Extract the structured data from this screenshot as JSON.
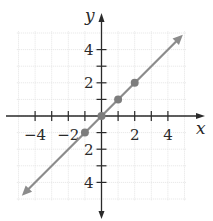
{
  "chart_data": {
    "type": "line",
    "title": "",
    "xlabel": "x",
    "ylabel": "y",
    "xlim": [
      -5,
      5
    ],
    "ylim": [
      -5,
      5
    ],
    "grid": true,
    "x_ticks": [
      -4,
      -3,
      -2,
      -1,
      1,
      2,
      3,
      4
    ],
    "y_ticks": [
      -4,
      -3,
      -2,
      -1,
      1,
      2,
      3,
      4
    ],
    "x_tick_labels": [
      {
        "value": -4,
        "text": "−4"
      },
      {
        "value": -2,
        "text": "−2"
      },
      {
        "value": 2,
        "text": "2"
      },
      {
        "value": 4,
        "text": "4"
      }
    ],
    "y_tick_labels": [
      {
        "value": 4,
        "text": "4"
      },
      {
        "value": 2,
        "text": "2"
      },
      {
        "value": -2,
        "text": "2"
      },
      {
        "value": -4,
        "text": "4"
      }
    ],
    "series": [
      {
        "name": "y = x",
        "type": "line",
        "arrows": "both",
        "x": [
          -4.8,
          4.9
        ],
        "y": [
          -4.8,
          4.9
        ],
        "color": "#8c8c8c"
      },
      {
        "name": "points",
        "type": "scatter",
        "x": [
          -1,
          0,
          1,
          2
        ],
        "y": [
          -1,
          0,
          1,
          2
        ],
        "color": "#7d7d7d"
      }
    ]
  },
  "style": {
    "axis_color": "#2a2a2a",
    "grid_color": "#e4e4e4",
    "line_color": "#8c8c8c",
    "point_color": "#7d7d7d"
  }
}
